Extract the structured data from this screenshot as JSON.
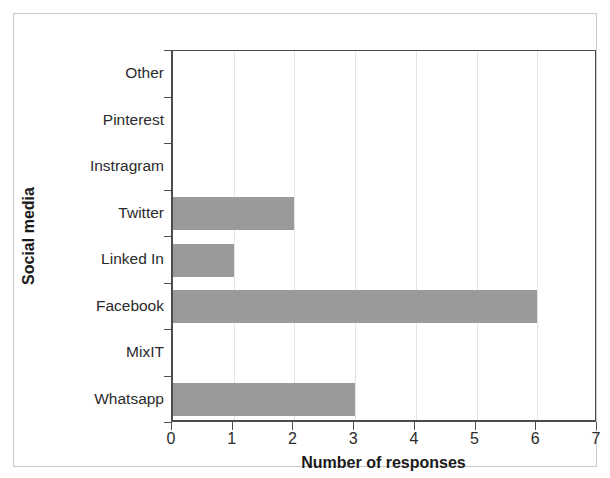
{
  "chart_data": {
    "type": "bar",
    "orientation": "horizontal",
    "title": "",
    "xlabel": "Number of responses",
    "ylabel": "Social media",
    "categories": [
      "Whatsapp",
      "MixIT",
      "Facebook",
      "Linked In",
      "Twitter",
      "Instragram",
      "Pinterest",
      "Other"
    ],
    "values": [
      3,
      0,
      6,
      1,
      2,
      0,
      0,
      0
    ],
    "series": [
      {
        "name": "Number of responses",
        "values": [
          3,
          0,
          6,
          1,
          2,
          0,
          0,
          0
        ]
      }
    ],
    "xlim": [
      0,
      7
    ],
    "xticks": [
      0,
      1,
      2,
      3,
      4,
      5,
      6,
      7
    ],
    "xtick_labels": [
      "0",
      "1",
      "2",
      "3",
      "4",
      "5",
      "6",
      "7"
    ],
    "grid": "vertical",
    "legend": "none",
    "bar_color": "#9a9a9a",
    "axis_color": "#4d4d4d",
    "gridline_color": "#e4e4e4",
    "frame_color": "#c9c9c9"
  },
  "axis": {
    "x_title": "Number of responses",
    "y_title": "Social media"
  },
  "ticks": {
    "x": [
      "0",
      "1",
      "2",
      "3",
      "4",
      "5",
      "6",
      "7"
    ],
    "y_top_to_bottom": [
      "Other",
      "Pinterest",
      "Instragram",
      "Twitter",
      "Linked In",
      "Facebook",
      "MixIT",
      "Whatsapp"
    ]
  }
}
